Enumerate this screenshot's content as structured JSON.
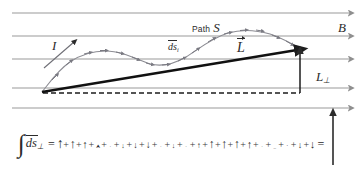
{
  "figure": {
    "type": "physics-vector-diagram",
    "background_color": "#ffffff",
    "ink_color": "#2b2b2b",
    "fieldline_color": "#9a9a9a",
    "path_color": "#8c8c93"
  },
  "labels": {
    "path_word": "Path",
    "path_symbol": "S",
    "field_symbol": "B",
    "current_symbol": "I",
    "segment_symbol": "ds",
    "segment_subscript": "i",
    "displacement_symbol": "L",
    "perp_symbol": "L",
    "perp_subscript": "⊥"
  },
  "field_lines": {
    "count": 5,
    "direction": "right",
    "y_positions": [
      13,
      36,
      59,
      88,
      108
    ],
    "x_start": 12,
    "x_end": 356,
    "color": "#9a9a9a"
  },
  "path": {
    "name": "Path S",
    "description": "wiggly current path with small tick arrows along it",
    "start": [
      42,
      92
    ],
    "end": [
      300,
      48
    ],
    "tick_count": 22,
    "points": [
      [
        42,
        92
      ],
      [
        50,
        83
      ],
      [
        58,
        74
      ],
      [
        66,
        66
      ],
      [
        74,
        60
      ],
      [
        82,
        56
      ],
      [
        92,
        53
      ],
      [
        102,
        51
      ],
      [
        112,
        51
      ],
      [
        122,
        53
      ],
      [
        132,
        57
      ],
      [
        142,
        61
      ],
      [
        152,
        64
      ],
      [
        162,
        65
      ],
      [
        172,
        63
      ],
      [
        182,
        59
      ],
      [
        192,
        53
      ],
      [
        202,
        46
      ],
      [
        212,
        40
      ],
      [
        222,
        35
      ],
      [
        232,
        32
      ],
      [
        242,
        30
      ],
      [
        252,
        30
      ],
      [
        262,
        32
      ],
      [
        272,
        35
      ],
      [
        282,
        40
      ],
      [
        292,
        45
      ],
      [
        300,
        48
      ]
    ]
  },
  "vectors": {
    "L": {
      "label": "L",
      "from": [
        42,
        92
      ],
      "to": [
        300,
        49
      ],
      "style": "thick-solid-arrow"
    },
    "L_perp": {
      "label": "L⊥",
      "from": [
        300,
        92
      ],
      "to": [
        300,
        50
      ],
      "style": "thin-solid-arrow"
    },
    "baseline": {
      "from": [
        42,
        93
      ],
      "to": [
        300,
        93
      ],
      "style": "dashed"
    },
    "current_arrow": {
      "label": "I",
      "style": "thin-solid-arrow",
      "from": [
        44,
        68
      ],
      "to": [
        74,
        42
      ]
    }
  },
  "equation": {
    "integral_symbol": "∫",
    "integrand": "ds",
    "integrand_subscript": "⊥",
    "equals": "=",
    "plus": "+",
    "result_symbol": "↑",
    "result_description": "single long upward arrow equal to L perpendicular",
    "terms": [
      {
        "glyph": "↑",
        "size": 14,
        "dir": "up"
      },
      {
        "glyph": "↑",
        "size": 13,
        "dir": "up"
      },
      {
        "glyph": "↑",
        "size": 11,
        "dir": "up"
      },
      {
        "glyph": "⮝",
        "size": 5,
        "dir": "up"
      },
      {
        "glyph": "·",
        "size": 5,
        "dir": "flat"
      },
      {
        "glyph": "↓",
        "size": 7,
        "dir": "down"
      },
      {
        "glyph": "↓",
        "size": 9,
        "dir": "down"
      },
      {
        "glyph": "↓",
        "size": 10,
        "dir": "down"
      },
      {
        "glyph": "·",
        "size": 5,
        "dir": "flat"
      },
      {
        "glyph": "↓",
        "size": 7,
        "dir": "down"
      },
      {
        "glyph": "·",
        "size": 5,
        "dir": "flat"
      },
      {
        "glyph": "↑",
        "size": 8,
        "dir": "up"
      },
      {
        "glyph": "↑",
        "size": 12,
        "dir": "up"
      },
      {
        "glyph": "↑",
        "size": 13,
        "dir": "up"
      },
      {
        "glyph": "↑",
        "size": 12,
        "dir": "up"
      },
      {
        "glyph": "↑",
        "size": 11,
        "dir": "up"
      },
      {
        "glyph": "·",
        "size": 5,
        "dir": "flat"
      },
      {
        "glyph": "_",
        "size": 5,
        "dir": "flat"
      },
      {
        "glyph": "·",
        "size": 6,
        "dir": "flat"
      },
      {
        "glyph": "↓",
        "size": 9,
        "dir": "down"
      },
      {
        "glyph": "↓",
        "size": 11,
        "dir": "down"
      }
    ]
  }
}
